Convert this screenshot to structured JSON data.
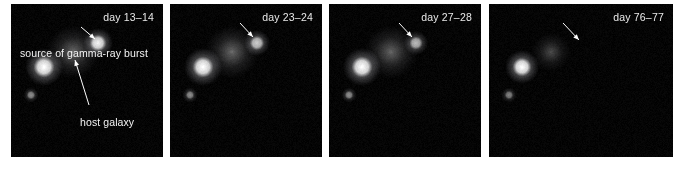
{
  "figure": {
    "background": "#ffffff",
    "panel_background": "#000000",
    "text_color": "#f2f2f2"
  },
  "annotations": {
    "grb_label": "source of gamma-ray burst",
    "host_label": "host galaxy"
  },
  "panels": [
    {
      "id": "panel-1",
      "day_label": "day 13–14",
      "x": 11,
      "width": 152,
      "objects": [
        {
          "name": "foreground-star",
          "cx": 33,
          "cy": 63,
          "r": 9.5,
          "brightness": 1.0,
          "shape": "point"
        },
        {
          "name": "faint-star",
          "cx": 20,
          "cy": 91,
          "r": 3.8,
          "brightness": 0.55,
          "shape": "point"
        },
        {
          "name": "host-galaxy",
          "cx": 62,
          "cy": 48,
          "r": 11.0,
          "brightness": 0.42,
          "shape": "diffuse"
        },
        {
          "name": "grb-afterglow",
          "cx": 87,
          "cy": 39,
          "r": 7.5,
          "brightness": 0.95,
          "shape": "point"
        }
      ],
      "arrows": [
        {
          "name": "grb-arrow",
          "x1": 70,
          "y1": 23,
          "x2": 84,
          "y2": 35
        },
        {
          "name": "host-arrow",
          "x1": 78,
          "y1": 101,
          "x2": 64,
          "y2": 56
        }
      ]
    },
    {
      "id": "panel-2",
      "day_label": "day 23–24",
      "x": 170,
      "width": 152,
      "objects": [
        {
          "name": "foreground-star",
          "cx": 33,
          "cy": 63,
          "r": 9.5,
          "brightness": 1.0,
          "shape": "point"
        },
        {
          "name": "faint-star",
          "cx": 20,
          "cy": 91,
          "r": 3.8,
          "brightness": 0.55,
          "shape": "point"
        },
        {
          "name": "host-galaxy",
          "cx": 62,
          "cy": 48,
          "r": 11.0,
          "brightness": 0.42,
          "shape": "diffuse"
        },
        {
          "name": "grb-afterglow",
          "cx": 87,
          "cy": 39,
          "r": 6.5,
          "brightness": 0.8,
          "shape": "point"
        }
      ],
      "arrows": [
        {
          "name": "grb-arrow",
          "x1": 70,
          "y1": 19,
          "x2": 83,
          "y2": 33
        }
      ]
    },
    {
      "id": "panel-3",
      "day_label": "day 27–28",
      "x": 329,
      "width": 152,
      "objects": [
        {
          "name": "foreground-star",
          "cx": 33,
          "cy": 63,
          "r": 9.5,
          "brightness": 1.0,
          "shape": "point"
        },
        {
          "name": "faint-star",
          "cx": 20,
          "cy": 91,
          "r": 3.8,
          "brightness": 0.55,
          "shape": "point"
        },
        {
          "name": "host-galaxy",
          "cx": 62,
          "cy": 48,
          "r": 11.0,
          "brightness": 0.4,
          "shape": "diffuse"
        },
        {
          "name": "grb-afterglow",
          "cx": 87,
          "cy": 39,
          "r": 6.0,
          "brightness": 0.72,
          "shape": "point"
        }
      ],
      "arrows": [
        {
          "name": "grb-arrow",
          "x1": 70,
          "y1": 19,
          "x2": 83,
          "y2": 33
        }
      ]
    },
    {
      "id": "panel-4",
      "day_label": "day 76–77",
      "x": 489,
      "width": 184,
      "objects": [
        {
          "name": "foreground-star",
          "cx": 33,
          "cy": 63,
          "r": 8.5,
          "brightness": 1.0,
          "shape": "point"
        },
        {
          "name": "faint-star",
          "cx": 20,
          "cy": 91,
          "r": 3.8,
          "brightness": 0.5,
          "shape": "point"
        },
        {
          "name": "host-galaxy",
          "cx": 62,
          "cy": 48,
          "r": 8.0,
          "brightness": 0.3,
          "shape": "diffuse"
        }
      ],
      "arrows": [
        {
          "name": "grb-arrow",
          "x1": 74,
          "y1": 19,
          "x2": 90,
          "y2": 36
        }
      ]
    }
  ]
}
